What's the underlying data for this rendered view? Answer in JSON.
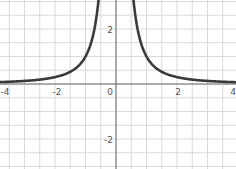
{
  "chart_data": {
    "type": "line",
    "title": "",
    "function": "y = 1/x^2",
    "xlabel": "",
    "ylabel": "",
    "xlim": [
      -4,
      4
    ],
    "ylim": [
      -2.6,
      3.0
    ],
    "grid": true,
    "grid_step": 0.5,
    "x_ticks": [
      -4,
      -2,
      0,
      2,
      4
    ],
    "x_tick_labels": [
      "-4",
      "-2",
      "0",
      "2",
      "4"
    ],
    "y_ticks": [
      2,
      -2
    ],
    "y_tick_labels": [
      "2",
      "-2"
    ],
    "series": [
      {
        "name": "f(x) = 1/x^2",
        "color": "#3a3a3a",
        "x": [
          -4,
          -3,
          -2,
          -1.5,
          -1,
          -0.8,
          -0.6,
          -0.58,
          0.58,
          0.6,
          0.8,
          1,
          1.5,
          2,
          3,
          4
        ],
        "y": [
          0.0625,
          0.111,
          0.25,
          0.444,
          1,
          1.5625,
          2.778,
          2.97,
          2.97,
          2.778,
          1.5625,
          1,
          0.444,
          0.25,
          0.111,
          0.0625
        ]
      }
    ],
    "legend": []
  },
  "labels": {
    "x_neg4": "-4",
    "x_neg2": "-2",
    "x_0": "0",
    "x_2": "2",
    "x_4": "4",
    "y_2": "2",
    "y_neg2": "-2"
  },
  "colors": {
    "grid": "#d9d9d9",
    "axis": "#6a6a6a",
    "curve": "#3a3a3a",
    "background": "#ffffff"
  }
}
